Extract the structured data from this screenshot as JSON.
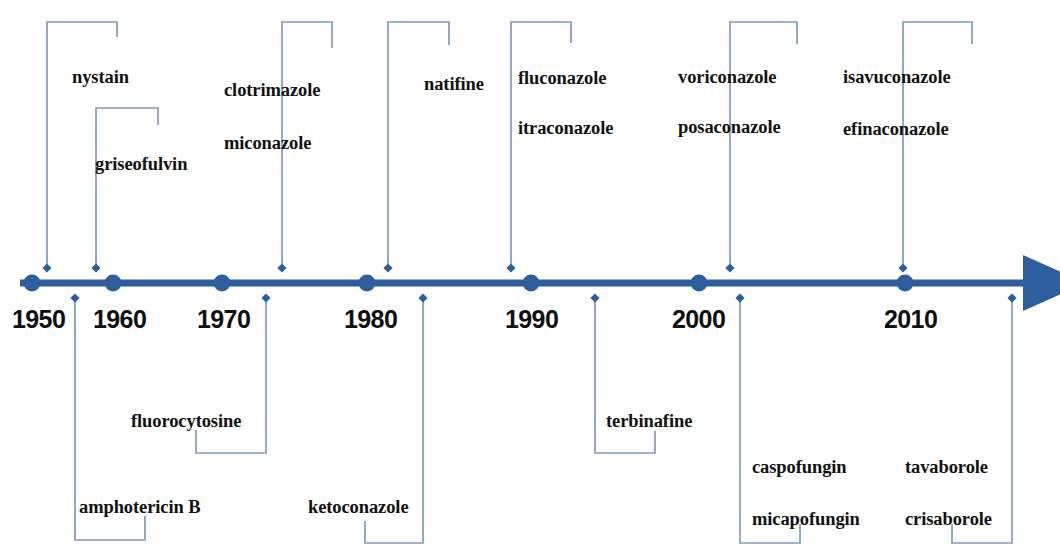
{
  "figure": {
    "kind": "timeline",
    "colors": {
      "axis": "#3A6FB0",
      "axis_dark": "#2E5E9E",
      "connector": "#7E9CC4",
      "text": "#121212"
    },
    "axis": {
      "arrow_label": "time-arrow",
      "start_x": 20,
      "end_x": 1040,
      "y": 283
    }
  },
  "years": [
    {
      "label": "1950",
      "x": 12,
      "dot_x": 32
    },
    {
      "label": "1960",
      "x": 93,
      "dot_x": 113
    },
    {
      "label": "1970",
      "x": 197,
      "dot_x": 222
    },
    {
      "label": "1980",
      "x": 344,
      "dot_x": 367
    },
    {
      "label": "1990",
      "x": 505,
      "dot_x": 531
    },
    {
      "label": "2000",
      "x": 672,
      "dot_x": 699
    },
    {
      "label": "2010",
      "x": 884,
      "dot_x": 905
    }
  ],
  "groups_above": [
    {
      "id": "nystain",
      "labels": [
        "nystain"
      ],
      "label_x": 72,
      "label_y": 68,
      "bracket": {
        "stem_x": 47,
        "top_y": 22,
        "arm_x": 117,
        "arm_drop_y": 37,
        "tip_y": 268
      }
    },
    {
      "id": "griseofulvin",
      "labels": [
        "griseofulvin"
      ],
      "label_x": 95,
      "label_y": 155,
      "bracket": {
        "stem_x": 96,
        "top_y": 108,
        "arm_x": 158,
        "arm_drop_y": 125,
        "tip_y": 268
      }
    },
    {
      "id": "clotrimazole-miconazole",
      "labels": [
        "clotrimazole",
        "miconazole"
      ],
      "label_x": 224,
      "label_y": 81,
      "label_y2": 134,
      "bracket": {
        "stem_x": 282,
        "top_y": 22,
        "arm_x": 332,
        "arm_drop_y": 48,
        "tip_y": 268
      }
    },
    {
      "id": "natifine",
      "labels": [
        "natifine"
      ],
      "label_x": 424,
      "label_y": 75,
      "bracket": {
        "stem_x": 388,
        "top_y": 22,
        "arm_x": 449,
        "arm_drop_y": 45,
        "tip_y": 268
      }
    },
    {
      "id": "fluconazole-itraconazole",
      "labels": [
        "fluconazole",
        "itraconazole"
      ],
      "label_x": 518,
      "label_y": 69,
      "label_y2": 119,
      "bracket": {
        "stem_x": 511,
        "top_y": 22,
        "arm_x": 571,
        "arm_drop_y": 43,
        "tip_y": 268
      }
    },
    {
      "id": "voriconazole-posaconazole",
      "labels": [
        "voriconazole",
        "posaconazole"
      ],
      "label_x": 678,
      "label_y": 68,
      "label_y2": 118,
      "bracket": {
        "stem_x": 730,
        "top_y": 22,
        "arm_x": 797,
        "arm_drop_y": 44,
        "tip_y": 268
      }
    },
    {
      "id": "isavuconazole-efinaconazole",
      "labels": [
        "isavuconazole",
        "efinaconazole"
      ],
      "label_x": 843,
      "label_y": 68,
      "label_y2": 120,
      "bracket": {
        "stem_x": 903,
        "top_y": 22,
        "arm_x": 972,
        "arm_drop_y": 44,
        "tip_y": 268
      }
    }
  ],
  "groups_below": [
    {
      "id": "amphotericin-b",
      "labels": [
        "amphotericin B"
      ],
      "label_x": 79,
      "label_y": 498,
      "bracket": {
        "stem_x": 75,
        "tip_y": 298,
        "bottom_y": 540,
        "arm_x": 145,
        "arm_rise_y": 516
      }
    },
    {
      "id": "fluorocytosine",
      "labels": [
        "fluorocytosine"
      ],
      "label_x": 131,
      "label_y": 412,
      "bracket": {
        "stem_x": 266,
        "tip_y": 298,
        "bottom_y": 453,
        "arm_x": 196,
        "arm_rise_y": 430
      }
    },
    {
      "id": "ketoconazole",
      "labels": [
        "ketoconazole"
      ],
      "label_x": 308,
      "label_y": 498,
      "bracket": {
        "stem_x": 423,
        "tip_y": 298,
        "bottom_y": 543,
        "arm_x": 365,
        "arm_rise_y": 521
      }
    },
    {
      "id": "terbinafine",
      "labels": [
        "terbinafine"
      ],
      "label_x": 606,
      "label_y": 412,
      "bracket": {
        "stem_x": 595,
        "tip_y": 298,
        "bottom_y": 453,
        "arm_x": 655,
        "arm_rise_y": 431
      }
    },
    {
      "id": "caspofungin-micapofungin",
      "labels": [
        "caspofungin",
        "micapofungin"
      ],
      "label_x": 752,
      "label_y": 458,
      "label_y2": 510,
      "bracket": {
        "stem_x": 740,
        "tip_y": 298,
        "bottom_y": 543,
        "arm_x": 800,
        "arm_rise_y": 524
      }
    },
    {
      "id": "tavaborole-crisaborole",
      "labels": [
        "tavaborole",
        "crisaborole"
      ],
      "label_x": 905,
      "label_y": 458,
      "label_y2": 510,
      "bracket": {
        "stem_x": 1012,
        "tip_y": 298,
        "bottom_y": 543,
        "arm_x": 952,
        "arm_rise_y": 524
      }
    }
  ]
}
